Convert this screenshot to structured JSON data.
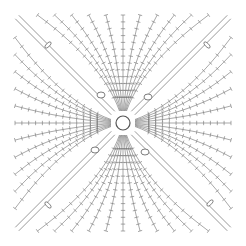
{
  "diagram": {
    "type": "crochet-granny-square-chart",
    "width": 246,
    "height": 246,
    "background": "#ffffff",
    "stroke_color": "#6e6e6e",
    "center": [
      123,
      123
    ],
    "center_ring_radius": 7,
    "rounds": 14,
    "square_half_size": 108,
    "stitches_per_side": 12,
    "corner_loops": [
      {
        "x": 101,
        "y": 95
      },
      {
        "x": 148,
        "y": 97
      },
      {
        "x": 95,
        "y": 150
      },
      {
        "x": 145,
        "y": 152
      }
    ],
    "corner_ovals": [
      {
        "x": 48,
        "y": 45,
        "angle": -45
      },
      {
        "x": 207,
        "y": 45,
        "angle": 45
      },
      {
        "x": 48,
        "y": 205,
        "angle": 45
      },
      {
        "x": 210,
        "y": 203,
        "angle": -45
      }
    ],
    "legend": []
  }
}
